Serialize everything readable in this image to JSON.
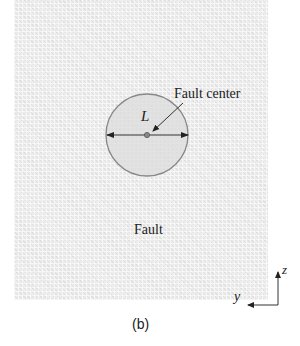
{
  "figure": {
    "caption": "(b)",
    "region_label": "Fault",
    "fault_center_label": "Fault center",
    "diameter_label": "L",
    "axes": {
      "vertical": "z",
      "horizontal": "y"
    },
    "colors": {
      "background_texture": "#ececec",
      "circle_fill": "#dcdcdc",
      "circle_stroke": "#888888",
      "lines": "#333333"
    }
  }
}
